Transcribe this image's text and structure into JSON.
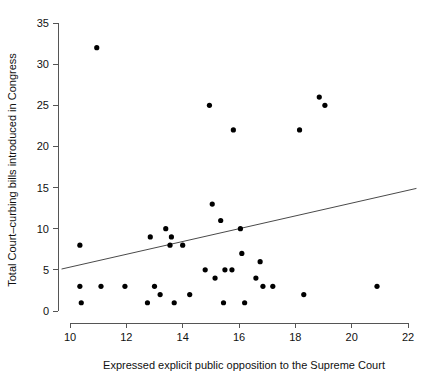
{
  "chart_data": {
    "type": "scatter",
    "title": "",
    "subtitle": "",
    "xlabel": "Expressed explicit public opposition to the Supreme Court",
    "ylabel": "Total Court–curbing bills introduced in Congress",
    "xlim": [
      9.7,
      22.3
    ],
    "ylim": [
      -0.8,
      35.6
    ],
    "xticks": [
      10,
      12,
      14,
      16,
      18,
      20,
      22
    ],
    "xtick_labels": [
      "10",
      "12",
      "14",
      "16",
      "18",
      "20",
      "22"
    ],
    "yticks": [
      0,
      5,
      10,
      15,
      20,
      25,
      30,
      35
    ],
    "ytick_labels": [
      "0",
      "5",
      "10",
      "15",
      "20",
      "25",
      "30",
      "35"
    ],
    "grid": false,
    "legend": null,
    "legend_position": "none",
    "point_color": "#000000",
    "point_radius": 2.6,
    "axis_color": "#555555",
    "background_color": "#ffffff",
    "points": [
      {
        "x": 10.95,
        "y": 32
      },
      {
        "x": 10.35,
        "y": 8
      },
      {
        "x": 10.35,
        "y": 3
      },
      {
        "x": 10.4,
        "y": 1
      },
      {
        "x": 11.1,
        "y": 3
      },
      {
        "x": 11.95,
        "y": 3
      },
      {
        "x": 12.75,
        "y": 1
      },
      {
        "x": 12.85,
        "y": 9
      },
      {
        "x": 13.0,
        "y": 3
      },
      {
        "x": 13.2,
        "y": 2
      },
      {
        "x": 13.4,
        "y": 10
      },
      {
        "x": 13.55,
        "y": 8
      },
      {
        "x": 13.6,
        "y": 9
      },
      {
        "x": 13.7,
        "y": 1
      },
      {
        "x": 14.0,
        "y": 8
      },
      {
        "x": 14.25,
        "y": 2
      },
      {
        "x": 14.8,
        "y": 5
      },
      {
        "x": 14.95,
        "y": 25
      },
      {
        "x": 15.05,
        "y": 13
      },
      {
        "x": 15.15,
        "y": 4
      },
      {
        "x": 15.35,
        "y": 11
      },
      {
        "x": 15.45,
        "y": 1
      },
      {
        "x": 15.5,
        "y": 5
      },
      {
        "x": 15.75,
        "y": 5
      },
      {
        "x": 15.8,
        "y": 22
      },
      {
        "x": 16.05,
        "y": 10
      },
      {
        "x": 16.1,
        "y": 7
      },
      {
        "x": 16.2,
        "y": 1
      },
      {
        "x": 16.6,
        "y": 4
      },
      {
        "x": 16.75,
        "y": 6
      },
      {
        "x": 16.85,
        "y": 3
      },
      {
        "x": 17.2,
        "y": 3
      },
      {
        "x": 18.15,
        "y": 22
      },
      {
        "x": 18.3,
        "y": 2
      },
      {
        "x": 18.85,
        "y": 26
      },
      {
        "x": 19.05,
        "y": 25
      },
      {
        "x": 20.9,
        "y": 3
      }
    ],
    "fit_line": {
      "label": "linear fit",
      "x_start": 9.7,
      "y_start": 5.1,
      "x_end": 22.3,
      "y_end": 14.9,
      "color": "#4a4a4a"
    }
  }
}
